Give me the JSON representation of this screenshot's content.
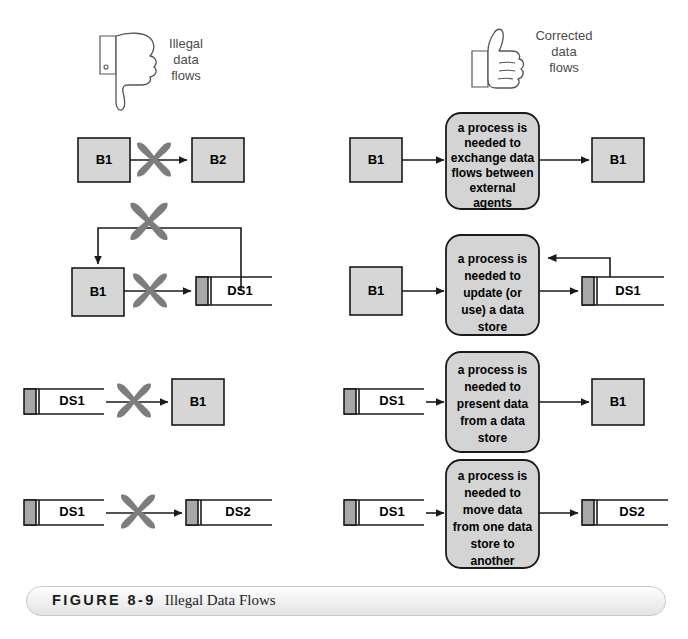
{
  "figure": {
    "number": "FIGURE 8-9",
    "title": "Illegal Data Flows"
  },
  "legend": {
    "illegal": {
      "icon": "thumbs-down-icon",
      "label": "Illegal\ndata\nflows",
      "lines": [
        "Illegal",
        "data",
        "flows"
      ]
    },
    "corrected": {
      "icon": "thumbs-up-icon",
      "label": "Corrected\ndata\nflows",
      "lines": [
        "Corrected",
        "data",
        "flows"
      ]
    }
  },
  "colors": {
    "entity_fill": "#d6d6d6",
    "process_fill": "#d4d4d4",
    "datastore_fill": "#ffffff",
    "datastore_tab": "#a8a8a8",
    "stroke": "#1a1a1a",
    "cross_mark": "#7d7d7d",
    "legend_text": "#4a4a4a",
    "caption_border": "#c9c9c9"
  },
  "rows": [
    {
      "id": "row-1",
      "illegal": {
        "source": {
          "type": "external-entity",
          "label": "B1"
        },
        "target": {
          "type": "external-entity",
          "label": "B2"
        },
        "crossed": true,
        "description": "external agent to external agent"
      },
      "corrected": {
        "source": {
          "type": "external-entity",
          "label": "B1"
        },
        "process": {
          "type": "process",
          "label": "a process is needed to exchange data flows between external agents",
          "lines": [
            "a process is",
            "needed to",
            "exchange data",
            "flows between",
            "external",
            "agents"
          ]
        },
        "target": {
          "type": "external-entity",
          "label": "B1"
        }
      }
    },
    {
      "id": "row-2",
      "illegal": {
        "source": {
          "type": "external-entity",
          "label": "B1"
        },
        "target": {
          "type": "data-store",
          "label": "DS1"
        },
        "crossed": true,
        "feedback": true,
        "description": "external agent to data store with feedback"
      },
      "corrected": {
        "source": {
          "type": "external-entity",
          "label": "B1"
        },
        "process": {
          "type": "process",
          "label": "a process is needed to update (or use) a data store",
          "lines": [
            "a process is",
            "needed to",
            "update (or",
            "use) a data",
            "store"
          ]
        },
        "target": {
          "type": "data-store",
          "label": "DS1"
        },
        "feedback": true
      }
    },
    {
      "id": "row-3",
      "illegal": {
        "source": {
          "type": "data-store",
          "label": "DS1"
        },
        "target": {
          "type": "external-entity",
          "label": "B1"
        },
        "crossed": true,
        "description": "data store to external agent"
      },
      "corrected": {
        "source": {
          "type": "data-store",
          "label": "DS1"
        },
        "process": {
          "type": "process",
          "label": "a process is needed to present data from a data store",
          "lines": [
            "a process is",
            "needed to",
            "present data",
            "from a data",
            "store"
          ]
        },
        "target": {
          "type": "external-entity",
          "label": "B1"
        }
      }
    },
    {
      "id": "row-4",
      "illegal": {
        "source": {
          "type": "data-store",
          "label": "DS1"
        },
        "target": {
          "type": "data-store",
          "label": "DS2"
        },
        "crossed": true,
        "description": "data store to data store"
      },
      "corrected": {
        "source": {
          "type": "data-store",
          "label": "DS1"
        },
        "process": {
          "type": "process",
          "label": "a process is needed to move data from one data store to another",
          "lines": [
            "a process is",
            "needed to",
            "move data",
            "from one data",
            "store to",
            "another"
          ]
        },
        "target": {
          "type": "data-store",
          "label": "DS2"
        }
      }
    }
  ]
}
